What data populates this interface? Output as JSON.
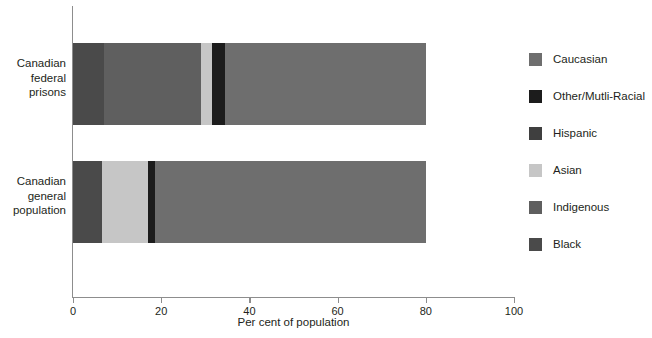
{
  "chart_data": {
    "type": "bar",
    "orientation": "horizontal",
    "stacked": true,
    "title": "",
    "xlabel": "Per cent of population",
    "ylabel": "",
    "xlim": [
      0,
      100
    ],
    "xticks": [
      0,
      20,
      40,
      60,
      80,
      100
    ],
    "xtick_labels": [
      "0",
      "20",
      "40",
      "60",
      "80",
      "100"
    ],
    "grid": false,
    "legend_position": "right",
    "categories": [
      "Canadian federal prisons",
      "Canadian general population"
    ],
    "category_label_lines": [
      [
        "Canadian",
        "federal",
        "prisons"
      ],
      [
        "Canadian",
        "general",
        "population"
      ]
    ],
    "series": [
      {
        "name": "Black",
        "color": "#4a4a4a",
        "values": [
          7.0,
          6.5
        ]
      },
      {
        "name": "Indigenous",
        "color": "#5f5f5f",
        "values": [
          22.0,
          0.0
        ]
      },
      {
        "name": "Asian",
        "color": "#c6c6c6",
        "values": [
          2.5,
          10.5
        ]
      },
      {
        "name": "Other/Mutli-Racial",
        "color": "#1c1c1c",
        "values": [
          3.0,
          1.5
        ]
      },
      {
        "name": "Hispanic",
        "color": "#3f3f3f",
        "values": [
          0.0,
          0.0
        ]
      },
      {
        "name": "Caucasian",
        "color": "#6e6e6e",
        "values": [
          45.5,
          61.5
        ]
      }
    ],
    "bar_totals": [
      80.0,
      80.0
    ],
    "legend_entries": [
      {
        "label": "Caucasian",
        "color": "#6e6e6e"
      },
      {
        "label": "Other/Mutli-Racial",
        "color": "#1c1c1c"
      },
      {
        "label": "Hispanic",
        "color": "#3f3f3f"
      },
      {
        "label": "Asian",
        "color": "#c6c6c6"
      },
      {
        "label": "Indigenous",
        "color": "#5f5f5f"
      },
      {
        "label": "Black",
        "color": "#4a4a4a"
      }
    ],
    "stack_order": [
      "Black",
      "Indigenous",
      "Asian",
      "Other/Mutli-Racial",
      "Caucasian"
    ],
    "axis_color": "#8d8d8d"
  }
}
